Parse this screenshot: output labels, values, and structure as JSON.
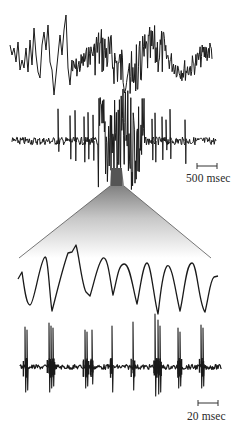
{
  "figure": {
    "panels": [
      {
        "id": "raw-trace-top",
        "description": "slow field potential with burst"
      },
      {
        "id": "filtered-trace-top",
        "description": "high-pass unit activity with burst"
      },
      {
        "id": "expanded-slow-wave",
        "description": "expanded view: oscillating slow waves"
      },
      {
        "id": "expanded-spikes",
        "description": "expanded view: spike bursts per cycle"
      }
    ],
    "scale_bars": [
      {
        "label": "500 msec"
      },
      {
        "label": "20 msec"
      }
    ],
    "colors": {
      "trace": "#1a1a1a",
      "funnel_top": "#6a6a6a",
      "funnel_bottom": "#ffffff"
    }
  }
}
